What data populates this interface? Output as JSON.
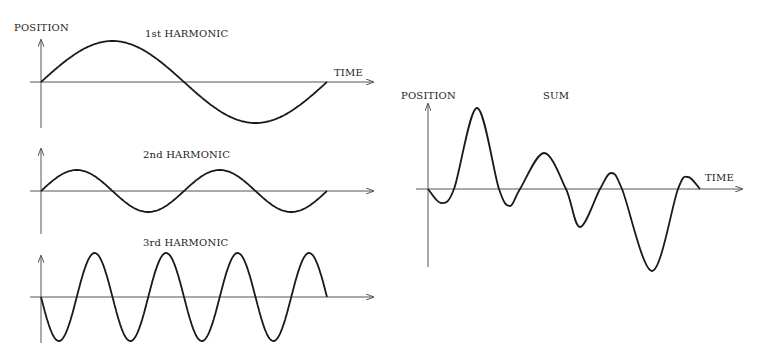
{
  "left_panel": {
    "y_label": "POSITION",
    "x_label": "TIME",
    "harmonics": [
      {
        "title": "1st HARMONIC",
        "cycles": 1,
        "amplitude": 41,
        "phase": "up"
      },
      {
        "title": "2nd HARMONIC",
        "cycles": 2,
        "amplitude": 21,
        "phase": "up"
      },
      {
        "title": "3rd HARMONIC",
        "cycles": 4,
        "amplitude": 44,
        "phase": "down"
      }
    ]
  },
  "right_panel": {
    "title": "SUM",
    "y_label": "POSITION",
    "x_label": "TIME"
  },
  "colors": {
    "line": "#1a1a1a",
    "axis": "#555555",
    "background": "#ffffff"
  }
}
